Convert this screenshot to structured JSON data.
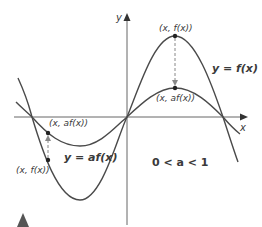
{
  "diagram": {
    "axes": {
      "x_label": "x",
      "y_label": "y"
    },
    "curves": {
      "original": {
        "label": "y = f(x)",
        "color": "#4a4a4a"
      },
      "transformed": {
        "label": "y = af(x)",
        "color": "#4a4a4a"
      }
    },
    "points": {
      "right_original": "(x, f(x))",
      "right_transformed": "(x, af(x))",
      "left_original": "(x, f(x))",
      "left_transformed": "(x, af(x))"
    },
    "condition": "0 < a < 1",
    "colors": {
      "axis": "#555555",
      "curve": "#4a4a4a",
      "dashed": "#888888",
      "marker": "#555555",
      "background": "#ffffff"
    }
  }
}
